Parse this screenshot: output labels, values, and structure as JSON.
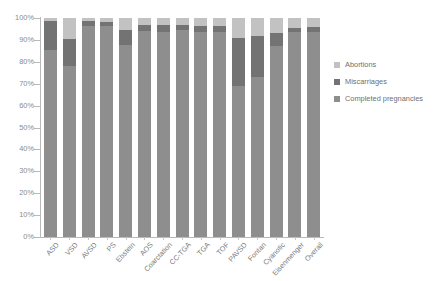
{
  "chart_data": {
    "type": "bar",
    "stacked": true,
    "stack_mode": "percent",
    "title": "",
    "xlabel": "",
    "ylabel": "",
    "ylim": [
      0,
      100
    ],
    "ytick_labels": [
      "100%",
      "90%",
      "80%",
      "70%",
      "60%",
      "50%",
      "40%",
      "30%",
      "20%",
      "10%",
      "0%"
    ],
    "ytick_values": [
      100,
      90,
      80,
      70,
      60,
      50,
      40,
      30,
      20,
      10,
      0
    ],
    "grid": false,
    "legend_position": "right",
    "categories": [
      "ASD",
      "VSD",
      "AVSD",
      "PS",
      "Ebstein",
      "AOS",
      "Coarctation",
      "CC-TGA",
      "TGA",
      "TOF",
      "PAVSD",
      "Fontan",
      "Cyanotic",
      "Eisenmenger",
      "Overall"
    ],
    "series": [
      {
        "name": "Completed pregnancies",
        "color": "#8e8e8e",
        "values": [
          85.5,
          78.0,
          96.5,
          96.5,
          87.5,
          94.0,
          93.5,
          94.5,
          93.5,
          93.5,
          69.0,
          73.0,
          87.0,
          93.5,
          93.5
        ]
      },
      {
        "name": "Miscarriages",
        "color": "#737373",
        "values": [
          13.0,
          12.5,
          2.0,
          1.5,
          7.0,
          3.0,
          3.5,
          2.5,
          3.0,
          3.0,
          22.0,
          19.0,
          6.0,
          2.0,
          2.5
        ]
      },
      {
        "name": "Abortions",
        "color": "#c2c2c2",
        "values": [
          1.5,
          9.5,
          1.5,
          2.0,
          5.5,
          3.0,
          3.0,
          3.0,
          3.5,
          3.5,
          9.0,
          8.0,
          7.0,
          4.5,
          4.0
        ]
      }
    ]
  },
  "legend": {
    "items": [
      {
        "label": "Abortions",
        "color": "#c2c2c2"
      },
      {
        "label": "Miscarriages",
        "color": "#737373"
      },
      {
        "label": "Completed pregnancies",
        "color": "#8e8e8e"
      }
    ]
  }
}
